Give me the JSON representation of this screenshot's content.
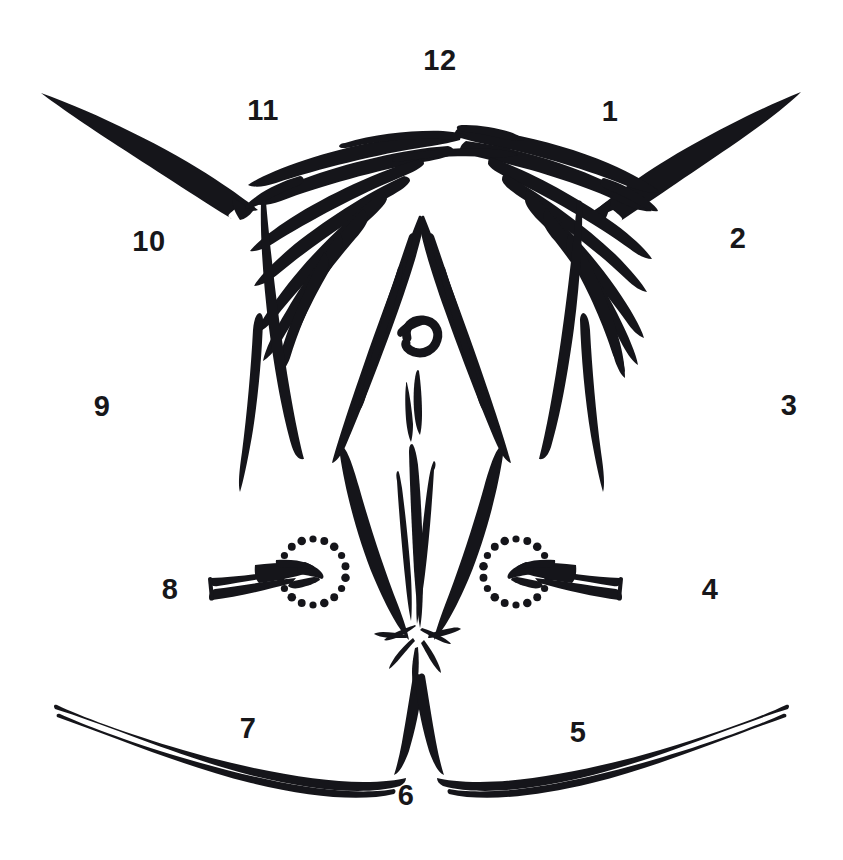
{
  "figure": {
    "background_color": "#ffffff",
    "ink_color": "#15151a",
    "width": 843,
    "height": 860
  },
  "labels": [
    {
      "text": "12",
      "x": 440,
      "y": 60,
      "name": "clock-label-12"
    },
    {
      "text": "1",
      "x": 610,
      "y": 111,
      "name": "clock-label-1"
    },
    {
      "text": "2",
      "x": 738,
      "y": 238,
      "name": "clock-label-2"
    },
    {
      "text": "3",
      "x": 789,
      "y": 405,
      "name": "clock-label-3"
    },
    {
      "text": "4",
      "x": 710,
      "y": 589,
      "name": "clock-label-4"
    },
    {
      "text": "5",
      "x": 578,
      "y": 732,
      "name": "clock-label-5"
    },
    {
      "text": "6",
      "x": 406,
      "y": 795,
      "name": "clock-label-6"
    },
    {
      "text": "7",
      "x": 248,
      "y": 728,
      "name": "clock-label-7"
    },
    {
      "text": "8",
      "x": 170,
      "y": 589,
      "name": "clock-label-8"
    },
    {
      "text": "9",
      "x": 102,
      "y": 406,
      "name": "clock-label-9"
    },
    {
      "text": "10",
      "x": 149,
      "y": 241,
      "name": "clock-label-10"
    },
    {
      "text": "11",
      "x": 263,
      "y": 110,
      "name": "clock-label-11"
    }
  ],
  "annotations": {
    "dotted_circles": [
      {
        "name": "dotted-circle-left",
        "cx": 313,
        "cy": 572,
        "r": 33,
        "dots": 18
      },
      {
        "name": "dotted-circle-right",
        "cx": 516,
        "cy": 572,
        "r": 33,
        "dots": 18
      }
    ],
    "arrows": [
      {
        "name": "arrow-left-pointing-right",
        "direction": "right",
        "tail_x": 214,
        "tail_y": 588,
        "tip_x": 307,
        "tip_y": 566
      },
      {
        "name": "arrow-right-pointing-left",
        "direction": "left",
        "tail_x": 617,
        "tail_y": 588,
        "tip_x": 521,
        "tip_y": 566
      }
    ]
  }
}
